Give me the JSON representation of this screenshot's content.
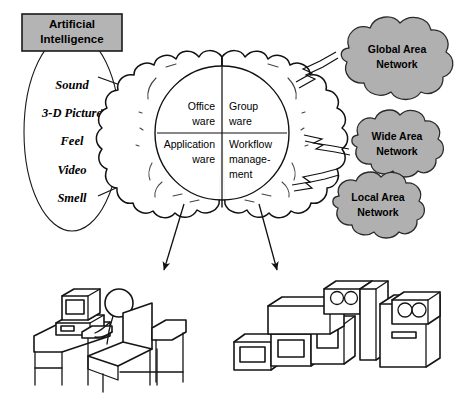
{
  "diagram": {
    "colors": {
      "cloud_gray": "#b0b0b0",
      "box_gray": "#b4b4b4",
      "line_black": "#111111",
      "page_background": "#ffffff"
    }
  },
  "ai_box": {
    "line1": "Artificial",
    "line2": "Intelligence"
  },
  "senses": {
    "items": [
      {
        "label": "Sound",
        "direction": "out"
      },
      {
        "label": "3-D Picture",
        "direction": "in"
      },
      {
        "label": "Feel",
        "direction": "out"
      },
      {
        "label": "Video",
        "direction": "in"
      },
      {
        "label": "Smell",
        "direction": "out"
      }
    ]
  },
  "brain": {
    "quadrants": [
      {
        "id": "top-left",
        "line1": "Office",
        "line2": "ware",
        "line3": ""
      },
      {
        "id": "top-right",
        "line1": "Group",
        "line2": "ware",
        "line3": ""
      },
      {
        "id": "bottom-left",
        "line1": "Application",
        "line2": "ware",
        "line3": ""
      },
      {
        "id": "bottom-right",
        "line1": "Workflow",
        "line2": "manage-",
        "line3": "ment"
      }
    ]
  },
  "networks": {
    "items": [
      {
        "id": "global",
        "line1": "Global Area",
        "line2": "Network"
      },
      {
        "id": "wide",
        "line1": "Wide Area",
        "line2": "Network"
      },
      {
        "id": "local",
        "line1": "Local Area",
        "line2": "Network"
      }
    ]
  },
  "illustrations": {
    "workstation": {
      "name": "person-at-desk-with-computer"
    },
    "servers": {
      "name": "server-and-tape-drive-equipment"
    }
  }
}
